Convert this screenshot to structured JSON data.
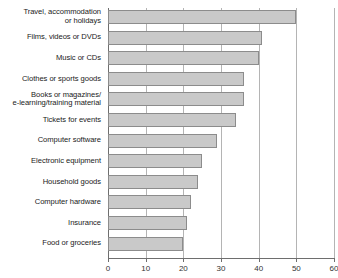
{
  "chart_data": {
    "type": "bar",
    "orientation": "horizontal",
    "title": "",
    "subtitle": "",
    "xlabel": "",
    "ylabel": "",
    "xlim": [
      0,
      60
    ],
    "xticks": [
      0,
      10,
      20,
      30,
      40,
      50,
      60
    ],
    "xtick_labels": [
      "0",
      "10",
      "20",
      "30",
      "40",
      "50",
      "60"
    ],
    "grid": true,
    "grid_axis": "x",
    "legend": false,
    "categories": [
      "Travel, accommodation\nor holidays",
      "Films, videos or DVDs",
      "Music or CDs",
      "Clothes or sports goods",
      "Books or magazines/\ne-learning/training material",
      "Tickets for events",
      "Computer software",
      "Electronic equipment",
      "Household goods",
      "Computer hardware",
      "Insurance",
      "Food or groceries"
    ],
    "values": [
      50,
      41,
      40,
      36,
      36,
      34,
      29,
      25,
      24,
      22,
      21,
      20
    ],
    "bar_fill_color": "#c9c9c9",
    "bar_border_color": "#8c8c8c",
    "gridline_color": "#b4b4b4",
    "axis_color": "#6e6e6e",
    "label_color": "#1a1a1a"
  }
}
